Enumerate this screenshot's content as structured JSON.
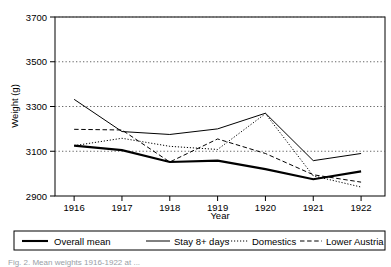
{
  "figure": {
    "background_color": "#ffffff",
    "axis_color": "#000000",
    "grid_color": "#555555",
    "caption_partial": "Fig. 2.  Mean weights 1916-1922 at ..."
  },
  "chart_data": {
    "type": "line",
    "title": "",
    "xlabel": "Year",
    "ylabel": "Weight (g)",
    "categories": [
      "1916",
      "1917",
      "1918",
      "1919",
      "1920",
      "1921",
      "1922"
    ],
    "x": [
      1916,
      1917,
      1918,
      1919,
      1920,
      1921,
      1922
    ],
    "xlim": [
      1915.6,
      1922.5
    ],
    "ylim": [
      2900,
      3700
    ],
    "yticks": [
      2900,
      3100,
      3300,
      3500,
      3700
    ],
    "ytick_labels": [
      "2900",
      "3100",
      "3300",
      "3500",
      "3700"
    ],
    "grid": "horizontal-dotted",
    "legend_position": "below-boxed",
    "series": [
      {
        "name": "Overall mean",
        "style": "solid-thick",
        "values": [
          3125,
          3105,
          3052,
          3058,
          3020,
          2975,
          3010
        ]
      },
      {
        "name": "Stay 8+ days",
        "style": "solid-thin",
        "values": [
          3332,
          3188,
          3175,
          3200,
          3270,
          3058,
          3090
        ]
      },
      {
        "name": "Domestics",
        "style": "dotted",
        "values": [
          3125,
          3158,
          3122,
          3108,
          3268,
          2990,
          2940
        ]
      },
      {
        "name": "Lower Austria",
        "style": "dashed",
        "values": [
          3198,
          3195,
          3052,
          3155,
          3090,
          2995,
          2962
        ]
      }
    ]
  },
  "legend": {
    "entries": [
      {
        "label": "Overall mean",
        "style": "solid-thick"
      },
      {
        "label": "Stay 8+ days",
        "style": "solid-thin"
      },
      {
        "label": "Domestics",
        "style": "dotted"
      },
      {
        "label": "Lower Austria",
        "style": "dashed"
      }
    ]
  }
}
